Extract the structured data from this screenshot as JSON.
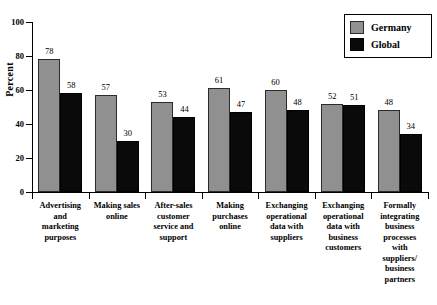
{
  "chart_data": {
    "type": "bar",
    "title": "",
    "xlabel": "",
    "ylabel": "Percent",
    "ylim": [
      0,
      100
    ],
    "yticks": [
      0,
      20,
      40,
      60,
      80,
      100
    ],
    "grid": false,
    "legend_position": "top-right",
    "categories": [
      "Advertising and marketing purposes",
      "Making sales online",
      "After-sales customer service and support",
      "Making purchases online",
      "Exchanging operational data with suppliers",
      "Exchanging operational data with business customers",
      "Formally integrating business processes with suppliers/ business partners"
    ],
    "category_lines": [
      [
        "Advertising",
        "and",
        "marketing",
        "purposes"
      ],
      [
        "Making sales",
        "online"
      ],
      [
        "After-sales",
        "customer",
        "service and",
        "support"
      ],
      [
        "Making",
        "purchases",
        "online"
      ],
      [
        "Exchanging",
        "operational",
        "data with",
        "suppliers"
      ],
      [
        "Exchanging",
        "operational",
        "data with",
        "business",
        "customers"
      ],
      [
        "Formally",
        "integrating",
        "business",
        "processes",
        "with",
        "suppliers/",
        "business",
        "partners"
      ]
    ],
    "series": [
      {
        "name": "Germany",
        "color": "#909090",
        "values": [
          78,
          57,
          53,
          61,
          60,
          52,
          48
        ]
      },
      {
        "name": "Global",
        "color": "#0a0a0a",
        "values": [
          58,
          30,
          44,
          47,
          48,
          51,
          34
        ]
      }
    ]
  }
}
